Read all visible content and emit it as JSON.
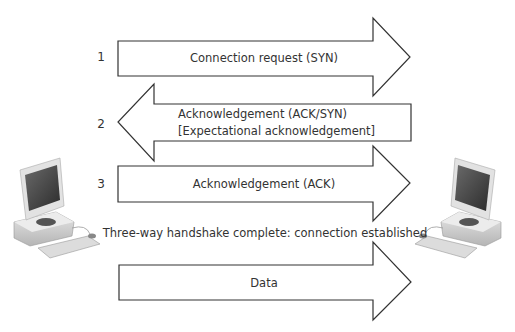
{
  "diagram": {
    "steps": [
      {
        "number": "1",
        "label": "Connection request (SYN)",
        "direction": "right"
      },
      {
        "number": "2",
        "label_line1": "Acknowledgement (ACK/SYN)",
        "label_line2": "[Expectational acknowledgement]",
        "direction": "left"
      },
      {
        "number": "3",
        "label": "Acknowledgement (ACK)",
        "direction": "right"
      }
    ],
    "status_text": "Three-way handshake complete: connection established",
    "data_arrow": {
      "label": "Data",
      "direction": "right"
    },
    "left_node": {
      "icon": "desktop-computer-icon"
    },
    "right_node": {
      "icon": "desktop-computer-icon"
    }
  }
}
